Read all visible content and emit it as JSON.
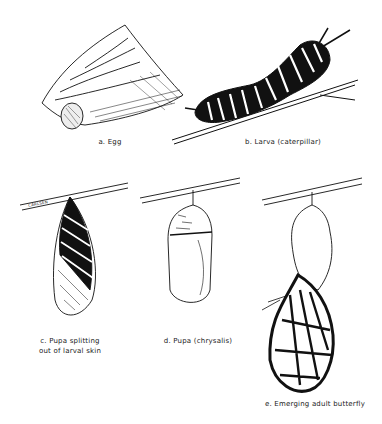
{
  "figure": {
    "stages": [
      {
        "id": "a",
        "label": "a. Egg"
      },
      {
        "id": "b",
        "label": "b. Larva (caterpillar)"
      },
      {
        "id": "c",
        "label_line1": "c. Pupa splitting",
        "label_line2": "out of larval skin"
      },
      {
        "id": "d",
        "label": "d. Pupa (chrysalis)"
      },
      {
        "id": "e",
        "label": "e. Emerging adult butterfly"
      }
    ],
    "signature": "CARLSEN"
  },
  "colors": {
    "ink": "#111111",
    "paper": "#ffffff"
  }
}
